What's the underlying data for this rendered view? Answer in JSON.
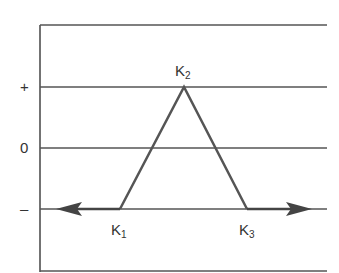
{
  "diagram": {
    "y_labels": {
      "plus": "+",
      "zero": "0",
      "minus": "–"
    },
    "points": [
      {
        "id": "K1",
        "letter": "K",
        "sub": "1"
      },
      {
        "id": "K2",
        "letter": "K",
        "sub": "2"
      },
      {
        "id": "K3",
        "letter": "K",
        "sub": "3"
      }
    ],
    "colors": {
      "grid": "#444444",
      "triangle": "#555555",
      "arrow": "#444444",
      "text": "#333333"
    }
  }
}
